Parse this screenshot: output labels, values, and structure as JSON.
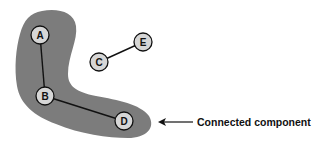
{
  "diagram": {
    "colors": {
      "component_fill": "#7c7c7c",
      "node_fill": "#d6d6d6",
      "stroke": "#111111",
      "background": "#ffffff"
    },
    "nodes": [
      {
        "id": "A",
        "label": "A",
        "x": 40,
        "y": 35
      },
      {
        "id": "B",
        "label": "B",
        "x": 45,
        "y": 96
      },
      {
        "id": "C",
        "label": "C",
        "x": 99,
        "y": 62
      },
      {
        "id": "D",
        "label": "D",
        "x": 124,
        "y": 121
      },
      {
        "id": "E",
        "label": "E",
        "x": 143,
        "y": 42
      }
    ],
    "edges": [
      {
        "from": "A",
        "to": "B"
      },
      {
        "from": "B",
        "to": "D"
      },
      {
        "from": "C",
        "to": "E"
      }
    ],
    "component": {
      "members": [
        "A",
        "B",
        "D"
      ]
    },
    "annotation": {
      "label": "Connected component",
      "arrow_direction": "left"
    }
  }
}
